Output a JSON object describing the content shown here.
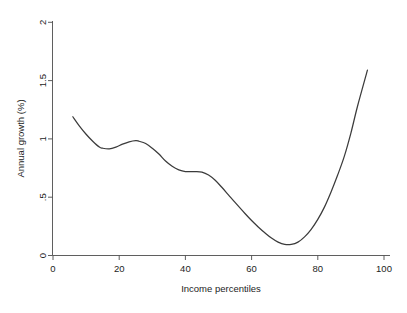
{
  "chart_data": {
    "type": "line",
    "title": "",
    "xlabel": "Income percentiles",
    "ylabel": "Annual growth (%)",
    "xlim": [
      0,
      100
    ],
    "ylim": [
      0,
      2
    ],
    "grid": false,
    "legend": null,
    "xticks": [
      "0",
      "20",
      "40",
      "60",
      "80",
      "100"
    ],
    "xtick_values": [
      0,
      20,
      40,
      60,
      80,
      100
    ],
    "yticks": [
      "0",
      ".5",
      "1",
      "1.5",
      "2"
    ],
    "ytick_values": [
      0,
      0.5,
      1,
      1.5,
      2
    ],
    "series": [
      {
        "name": "Annual growth",
        "color": "#3b3b3b",
        "x": [
          6,
          8,
          10,
          12,
          14,
          15,
          17,
          19,
          21,
          23,
          25,
          26,
          28,
          30,
          32,
          34,
          36,
          38,
          40,
          42,
          43,
          45,
          47,
          49,
          51,
          53,
          55,
          58,
          60,
          62,
          64,
          66,
          68,
          70,
          72,
          74,
          76,
          78,
          80,
          82,
          84,
          86,
          88,
          90,
          92,
          95
        ],
        "y": [
          1.19,
          1.11,
          1.04,
          0.98,
          0.93,
          0.92,
          0.915,
          0.93,
          0.955,
          0.975,
          0.985,
          0.98,
          0.96,
          0.92,
          0.87,
          0.81,
          0.765,
          0.735,
          0.72,
          0.72,
          0.72,
          0.715,
          0.69,
          0.645,
          0.585,
          0.52,
          0.455,
          0.36,
          0.3,
          0.245,
          0.195,
          0.15,
          0.115,
          0.095,
          0.095,
          0.115,
          0.16,
          0.225,
          0.31,
          0.415,
          0.545,
          0.69,
          0.85,
          1.05,
          1.28,
          1.59
        ]
      }
    ]
  },
  "axis": {
    "y_title": "Annual growth (%)",
    "x_title": "Income percentiles"
  }
}
